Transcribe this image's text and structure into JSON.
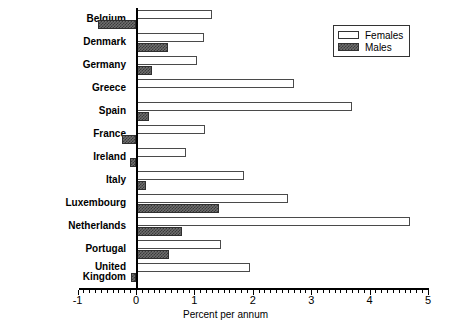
{
  "chart_data": {
    "type": "bar",
    "orientation": "horizontal",
    "title": "",
    "xlabel": "Percent per annum",
    "ylabel": "",
    "xlim": [
      -1,
      5
    ],
    "xticks": [
      -1,
      0,
      1,
      2,
      3,
      4,
      5
    ],
    "xtick_labels": [
      "-1",
      "0",
      "1",
      "2",
      "3",
      "4",
      "5"
    ],
    "minor_tick_step": 0.1,
    "grid": false,
    "legend_position": "top-right",
    "categories": [
      "Belgium",
      "Denmark",
      "Germany",
      "Greece",
      "Spain",
      "France",
      "Ireland",
      "Italy",
      "Luxembourg",
      "Netherlands",
      "Portugal",
      "United\nKingdom"
    ],
    "series": [
      {
        "name": "Females",
        "fill": "white",
        "values": [
          1.3,
          1.17,
          1.05,
          2.7,
          3.7,
          1.18,
          0.85,
          1.85,
          2.6,
          4.7,
          1.45,
          1.95
        ]
      },
      {
        "name": "Males",
        "fill": "hatched-dark",
        "values": [
          -0.65,
          0.55,
          0.28,
          0.0,
          0.22,
          -0.24,
          -0.1,
          0.17,
          1.42,
          0.78,
          0.57,
          -0.09
        ]
      }
    ]
  },
  "legend": {
    "items": [
      {
        "label": "Females",
        "swatch": "females"
      },
      {
        "label": "Males",
        "swatch": "males"
      }
    ]
  },
  "axis": {
    "x_title": "Percent per annum"
  },
  "footnote": {
    "text": ""
  }
}
